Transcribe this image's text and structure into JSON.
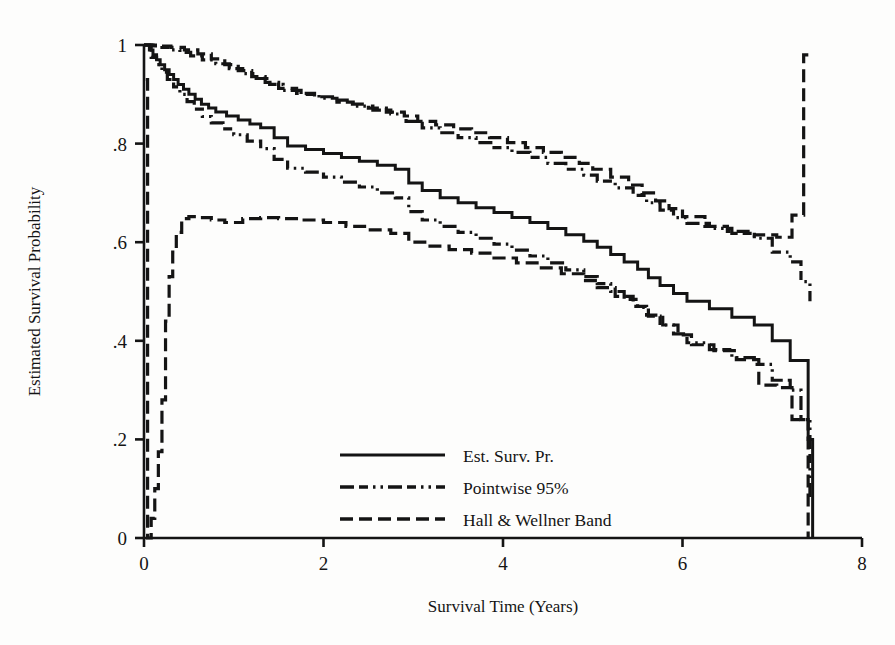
{
  "chart_data": {
    "type": "line",
    "title": "",
    "xlabel": "Survival Time (Years)",
    "ylabel": "Estimated Survival Probability",
    "xlim": [
      0,
      8
    ],
    "ylim": [
      0,
      1
    ],
    "xticks": [
      "0",
      "2",
      "4",
      "6",
      "8"
    ],
    "xtick_values": [
      0,
      2,
      4,
      6,
      8
    ],
    "yticks": [
      "0",
      ".2",
      ".4",
      ".6",
      ".8",
      "1"
    ],
    "ytick_values": [
      0,
      0.2,
      0.4,
      0.6,
      0.8,
      1
    ],
    "grid": false,
    "legend_position": "bottom-center",
    "line_color": "#141414",
    "background": "#fdfdfc",
    "series": [
      {
        "name": "Est. Surv. Pr.",
        "style": "solid",
        "points": [
          [
            0.0,
            1.0
          ],
          [
            0.06,
            0.99
          ],
          [
            0.1,
            0.98
          ],
          [
            0.14,
            0.97
          ],
          [
            0.18,
            0.96
          ],
          [
            0.23,
            0.95
          ],
          [
            0.28,
            0.94
          ],
          [
            0.33,
            0.93
          ],
          [
            0.38,
            0.92
          ],
          [
            0.44,
            0.91
          ],
          [
            0.5,
            0.9
          ],
          [
            0.57,
            0.89
          ],
          [
            0.64,
            0.88
          ],
          [
            0.72,
            0.872
          ],
          [
            0.8,
            0.864
          ],
          [
            0.92,
            0.856
          ],
          [
            1.05,
            0.848
          ],
          [
            1.18,
            0.84
          ],
          [
            1.3,
            0.832
          ],
          [
            1.45,
            0.812
          ],
          [
            1.6,
            0.795
          ],
          [
            1.8,
            0.788
          ],
          [
            2.0,
            0.78
          ],
          [
            2.2,
            0.772
          ],
          [
            2.4,
            0.764
          ],
          [
            2.6,
            0.756
          ],
          [
            2.8,
            0.748
          ],
          [
            2.95,
            0.72
          ],
          [
            3.1,
            0.705
          ],
          [
            3.3,
            0.69
          ],
          [
            3.5,
            0.68
          ],
          [
            3.7,
            0.67
          ],
          [
            3.9,
            0.66
          ],
          [
            4.1,
            0.65
          ],
          [
            4.3,
            0.64
          ],
          [
            4.5,
            0.628
          ],
          [
            4.7,
            0.615
          ],
          [
            4.9,
            0.602
          ],
          [
            5.05,
            0.59
          ],
          [
            5.2,
            0.575
          ],
          [
            5.35,
            0.56
          ],
          [
            5.5,
            0.545
          ],
          [
            5.62,
            0.528
          ],
          [
            5.75,
            0.512
          ],
          [
            5.9,
            0.496
          ],
          [
            6.05,
            0.48
          ],
          [
            6.3,
            0.465
          ],
          [
            6.55,
            0.448
          ],
          [
            6.8,
            0.432
          ],
          [
            7.0,
            0.4
          ],
          [
            7.2,
            0.36
          ],
          [
            7.4,
            0.2
          ],
          [
            7.45,
            0.0
          ]
        ]
      },
      {
        "name": "Pointwise 95% upper",
        "style": "dashdotdot",
        "points": [
          [
            0.0,
            1.0
          ],
          [
            0.1,
            0.998
          ],
          [
            0.2,
            0.995
          ],
          [
            0.3,
            0.99
          ],
          [
            0.4,
            0.985
          ],
          [
            0.52,
            0.978
          ],
          [
            0.65,
            0.97
          ],
          [
            0.8,
            0.962
          ],
          [
            0.95,
            0.952
          ],
          [
            1.1,
            0.942
          ],
          [
            1.25,
            0.932
          ],
          [
            1.4,
            0.92
          ],
          [
            1.55,
            0.908
          ],
          [
            1.75,
            0.9
          ],
          [
            1.95,
            0.892
          ],
          [
            2.15,
            0.884
          ],
          [
            2.35,
            0.876
          ],
          [
            2.55,
            0.868
          ],
          [
            2.75,
            0.86
          ],
          [
            2.92,
            0.845
          ],
          [
            3.1,
            0.832
          ],
          [
            3.3,
            0.822
          ],
          [
            3.5,
            0.812
          ],
          [
            3.7,
            0.802
          ],
          [
            3.9,
            0.792
          ],
          [
            4.1,
            0.782
          ],
          [
            4.3,
            0.772
          ],
          [
            4.5,
            0.76
          ],
          [
            4.7,
            0.748
          ],
          [
            4.9,
            0.736
          ],
          [
            5.05,
            0.724
          ],
          [
            5.25,
            0.71
          ],
          [
            5.45,
            0.695
          ],
          [
            5.6,
            0.68
          ],
          [
            5.75,
            0.665
          ],
          [
            5.9,
            0.65
          ],
          [
            6.05,
            0.638
          ],
          [
            6.3,
            0.628
          ],
          [
            6.55,
            0.618
          ],
          [
            6.8,
            0.608
          ],
          [
            7.0,
            0.58
          ],
          [
            7.2,
            0.56
          ],
          [
            7.32,
            0.52
          ],
          [
            7.42,
            0.48
          ]
        ]
      },
      {
        "name": "Pointwise 95% lower",
        "style": "dashdotdot",
        "points": [
          [
            0.0,
            1.0
          ],
          [
            0.08,
            0.975
          ],
          [
            0.14,
            0.96
          ],
          [
            0.2,
            0.945
          ],
          [
            0.26,
            0.93
          ],
          [
            0.33,
            0.915
          ],
          [
            0.4,
            0.9
          ],
          [
            0.48,
            0.885
          ],
          [
            0.56,
            0.87
          ],
          [
            0.65,
            0.855
          ],
          [
            0.75,
            0.842
          ],
          [
            0.88,
            0.83
          ],
          [
            1.0,
            0.818
          ],
          [
            1.15,
            0.805
          ],
          [
            1.3,
            0.79
          ],
          [
            1.45,
            0.768
          ],
          [
            1.6,
            0.75
          ],
          [
            1.8,
            0.742
          ],
          [
            2.0,
            0.732
          ],
          [
            2.2,
            0.722
          ],
          [
            2.4,
            0.712
          ],
          [
            2.6,
            0.7
          ],
          [
            2.8,
            0.69
          ],
          [
            2.95,
            0.662
          ],
          [
            3.1,
            0.645
          ],
          [
            3.3,
            0.632
          ],
          [
            3.5,
            0.62
          ],
          [
            3.7,
            0.608
          ],
          [
            3.9,
            0.596
          ],
          [
            4.1,
            0.584
          ],
          [
            4.3,
            0.572
          ],
          [
            4.5,
            0.558
          ],
          [
            4.7,
            0.544
          ],
          [
            4.9,
            0.53
          ],
          [
            5.05,
            0.516
          ],
          [
            5.2,
            0.5
          ],
          [
            5.35,
            0.484
          ],
          [
            5.5,
            0.468
          ],
          [
            5.62,
            0.45
          ],
          [
            5.75,
            0.432
          ],
          [
            5.9,
            0.414
          ],
          [
            6.05,
            0.396
          ],
          [
            6.3,
            0.382
          ],
          [
            6.55,
            0.366
          ],
          [
            6.8,
            0.352
          ],
          [
            7.0,
            0.32
          ],
          [
            7.2,
            0.3
          ],
          [
            7.32,
            0.24
          ],
          [
            7.42,
            0.08
          ]
        ]
      },
      {
        "name": "Hall & Wellner upper",
        "style": "dashed",
        "points": [
          [
            0.0,
            1.0
          ],
          [
            0.15,
            0.998
          ],
          [
            0.3,
            0.995
          ],
          [
            0.45,
            0.99
          ],
          [
            0.6,
            0.982
          ],
          [
            0.75,
            0.972
          ],
          [
            0.9,
            0.96
          ],
          [
            1.05,
            0.948
          ],
          [
            1.2,
            0.936
          ],
          [
            1.35,
            0.924
          ],
          [
            1.5,
            0.912
          ],
          [
            1.7,
            0.902
          ],
          [
            1.9,
            0.895
          ],
          [
            2.1,
            0.888
          ],
          [
            2.3,
            0.88
          ],
          [
            2.5,
            0.872
          ],
          [
            2.7,
            0.864
          ],
          [
            2.9,
            0.856
          ],
          [
            3.05,
            0.845
          ],
          [
            3.25,
            0.838
          ],
          [
            3.45,
            0.83
          ],
          [
            3.65,
            0.822
          ],
          [
            3.85,
            0.812
          ],
          [
            4.05,
            0.802
          ],
          [
            4.25,
            0.792
          ],
          [
            4.45,
            0.782
          ],
          [
            4.65,
            0.772
          ],
          [
            4.85,
            0.76
          ],
          [
            5.0,
            0.748
          ],
          [
            5.2,
            0.732
          ],
          [
            5.4,
            0.716
          ],
          [
            5.55,
            0.7
          ],
          [
            5.7,
            0.684
          ],
          [
            5.85,
            0.668
          ],
          [
            6.0,
            0.652
          ],
          [
            6.25,
            0.632
          ],
          [
            6.5,
            0.622
          ],
          [
            6.8,
            0.615
          ],
          [
            7.05,
            0.61
          ],
          [
            7.22,
            0.655
          ],
          [
            7.35,
            0.98
          ],
          [
            7.44,
            0.98
          ]
        ]
      },
      {
        "name": "Hall & Wellner lower",
        "style": "dashed",
        "points": [
          [
            0.02,
            0.93
          ],
          [
            0.04,
            0.0
          ],
          [
            0.08,
            0.04
          ],
          [
            0.12,
            0.1
          ],
          [
            0.16,
            0.175
          ],
          [
            0.2,
            0.28
          ],
          [
            0.24,
            0.44
          ],
          [
            0.28,
            0.53
          ],
          [
            0.32,
            0.58
          ],
          [
            0.36,
            0.62
          ],
          [
            0.42,
            0.648
          ],
          [
            0.5,
            0.652
          ],
          [
            0.6,
            0.65
          ],
          [
            0.75,
            0.645
          ],
          [
            0.9,
            0.64
          ],
          [
            1.1,
            0.648
          ],
          [
            1.3,
            0.65
          ],
          [
            1.5,
            0.648
          ],
          [
            1.75,
            0.645
          ],
          [
            2.0,
            0.64
          ],
          [
            2.25,
            0.632
          ],
          [
            2.5,
            0.625
          ],
          [
            2.75,
            0.618
          ],
          [
            2.95,
            0.6
          ],
          [
            3.15,
            0.592
          ],
          [
            3.4,
            0.585
          ],
          [
            3.65,
            0.578
          ],
          [
            3.9,
            0.568
          ],
          [
            4.15,
            0.558
          ],
          [
            4.4,
            0.548
          ],
          [
            4.65,
            0.536
          ],
          [
            4.9,
            0.522
          ],
          [
            5.05,
            0.508
          ],
          [
            5.25,
            0.49
          ],
          [
            5.45,
            0.47
          ],
          [
            5.6,
            0.452
          ],
          [
            5.78,
            0.432
          ],
          [
            5.95,
            0.412
          ],
          [
            6.1,
            0.392
          ],
          [
            6.35,
            0.38
          ],
          [
            6.6,
            0.362
          ],
          [
            6.85,
            0.31
          ],
          [
            7.05,
            0.305
          ],
          [
            7.22,
            0.24
          ],
          [
            7.35,
            0.24
          ],
          [
            7.4,
            0.0
          ]
        ]
      }
    ],
    "legend": [
      {
        "label": "Est. Surv. Pr.",
        "style": "solid"
      },
      {
        "label": "Pointwise 95%",
        "style": "dashdotdot"
      },
      {
        "label": "Hall & Wellner Band",
        "style": "dashed"
      }
    ]
  }
}
